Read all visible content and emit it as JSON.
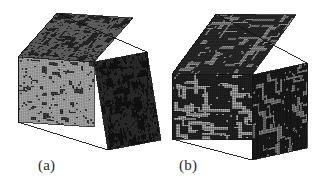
{
  "figure": {
    "background_color": "#ffffff",
    "width": 324,
    "height": 184,
    "caption_color": "#2a2a2a"
  },
  "panels": [
    {
      "id": "a",
      "caption": "(a)",
      "caption_x": 38,
      "caption_y": 157,
      "description": "Voxel cube with fine-grained speckled microstructure",
      "cube": {
        "vertices": {
          "left": [
            18,
            57
          ],
          "top": [
            57,
            13
          ],
          "right": [
            147,
            52
          ],
          "bottom": [
            108,
            150
          ],
          "front_bottom_left": [
            18,
            122
          ],
          "front_bottom_right": [
            108,
            150
          ],
          "back_right_bottom": [
            147,
            110
          ],
          "center_front": [
            94,
            62
          ]
        },
        "faces": {
          "front": {
            "name": "front-left-face",
            "base_color": "#a8a8a8",
            "cell_color": "#1a1a1a",
            "grid_color": "#6e6e6e",
            "grid_n": 42,
            "fill_ratio": 0.17,
            "cluster_bias": 0.55
          },
          "top": {
            "name": "top-face",
            "base_color": "#6a6a6a",
            "cell_color": "#141414",
            "grid_color": "#3c3c3c",
            "grid_n": 42,
            "fill_ratio": 0.42,
            "cluster_bias": 0.72
          },
          "right": {
            "name": "right-face",
            "base_color": "#2e2e2e",
            "cell_color": "#0c0c0c",
            "grid_color": "#1c1c1c",
            "grid_n": 42,
            "fill_ratio": 0.52,
            "cluster_bias": 0.62
          }
        },
        "seed": 20731,
        "pattern": "speckle"
      }
    },
    {
      "id": "b",
      "caption": "(b)",
      "caption_x": 179,
      "caption_y": 157,
      "description": "Voxel cube with coarse connected network microstructure",
      "cube": {
        "vertices": {
          "left": [
            172,
            74
          ],
          "top": [
            216,
            14
          ],
          "right": [
            307,
            63
          ],
          "bottom": [
            252,
            160
          ],
          "front_bottom_left": [
            172,
            139
          ],
          "front_bottom_right": [
            252,
            160
          ],
          "back_right_bottom": [
            307,
            122
          ],
          "center_front": [
            252,
            75
          ]
        },
        "faces": {
          "front": {
            "name": "front-left-face",
            "base_color": "#232323",
            "cell_color": "#b4b4b4",
            "grid_color": "#101010",
            "grid_n": 40,
            "fill_ratio": 0.2,
            "cluster_bias": 0.9
          },
          "top": {
            "name": "top-face",
            "base_color": "#2a2a2a",
            "cell_color": "#9a9a9a",
            "grid_color": "#141414",
            "grid_n": 40,
            "fill_ratio": 0.2,
            "cluster_bias": 0.9
          },
          "right": {
            "name": "right-face",
            "base_color": "#1c1c1c",
            "cell_color": "#8c8c8c",
            "grid_color": "#0c0c0c",
            "grid_n": 40,
            "fill_ratio": 0.17,
            "cluster_bias": 0.9
          }
        },
        "seed": 51199,
        "pattern": "network"
      }
    }
  ]
}
